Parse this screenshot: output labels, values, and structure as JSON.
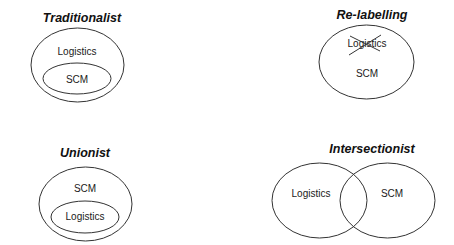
{
  "diagrams": [
    {
      "id": "traditionalist",
      "title": "Traditionalist",
      "labels": {
        "outer": "Logistics",
        "inner": "SCM"
      }
    },
    {
      "id": "re-labelling",
      "title": "Re-labelling",
      "labels": {
        "crossed_out": "Logistics",
        "main": "SCM"
      }
    },
    {
      "id": "unionist",
      "title": "Unionist",
      "labels": {
        "outer": "SCM",
        "inner": "Logistics"
      }
    },
    {
      "id": "intersectionist",
      "title": "Intersectionist",
      "labels": {
        "left": "Logistics",
        "right": "SCM"
      }
    }
  ]
}
